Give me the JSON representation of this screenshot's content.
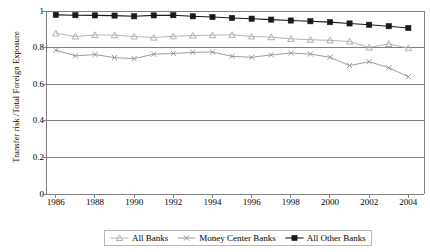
{
  "chart_data": {
    "type": "line",
    "title": "",
    "xlabel": "",
    "ylabel": "Transfer risk /Total Foreign Exposure",
    "x": [
      1986,
      1987,
      1988,
      1989,
      1990,
      1991,
      1992,
      1993,
      1994,
      1995,
      1996,
      1997,
      1998,
      1999,
      2000,
      2001,
      2002,
      2003,
      2004
    ],
    "xlim": [
      1985.5,
      2004.8
    ],
    "ylim": [
      0,
      1
    ],
    "yticks": [
      "0",
      "0.2",
      "0.4",
      "0.6",
      "0.8",
      "1"
    ],
    "ytick_values": [
      0,
      0.2,
      0.4,
      0.6,
      0.8,
      1
    ],
    "xticks": [
      "1986",
      "1988",
      "1990",
      "1992",
      "1994",
      "1996",
      "1998",
      "2000",
      "2002",
      "2004"
    ],
    "xtick_values": [
      1986,
      1988,
      1990,
      1992,
      1994,
      1996,
      1998,
      2000,
      2002,
      2004
    ],
    "grid": "horizontal",
    "legend_position": "bottom",
    "series": [
      {
        "name": "All Banks",
        "marker": "triangle",
        "color": "#a8a8a8",
        "values": [
          0.878,
          0.861,
          0.869,
          0.868,
          0.861,
          0.855,
          0.862,
          0.866,
          0.868,
          0.87,
          0.861,
          0.857,
          0.848,
          0.843,
          0.84,
          0.833,
          0.801,
          0.82,
          0.797
        ]
      },
      {
        "name": "Money Center Banks",
        "marker": "cross",
        "color": "#8a8a8a",
        "values": [
          0.786,
          0.755,
          0.762,
          0.745,
          0.74,
          0.764,
          0.768,
          0.774,
          0.776,
          0.752,
          0.747,
          0.76,
          0.77,
          0.765,
          0.747,
          0.702,
          0.723,
          0.69,
          0.641
        ]
      },
      {
        "name": "All Other Banks",
        "marker": "square",
        "color": "#1a1a1a",
        "values": [
          0.979,
          0.977,
          0.976,
          0.975,
          0.971,
          0.976,
          0.977,
          0.971,
          0.967,
          0.962,
          0.958,
          0.953,
          0.948,
          0.944,
          0.939,
          0.932,
          0.925,
          0.917,
          0.907
        ]
      }
    ]
  },
  "legend": {
    "items": [
      {
        "label": "All Banks"
      },
      {
        "label": "Money Center Banks"
      },
      {
        "label": "All Other Banks"
      }
    ]
  },
  "axes": {
    "y_title": "Transfer risk /Total Foreign Exposure"
  }
}
